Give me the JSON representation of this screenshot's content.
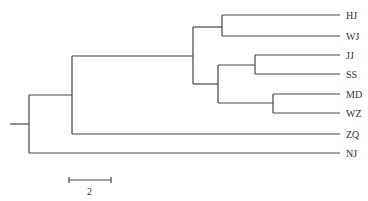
{
  "diagram": {
    "type": "phylogenetic-tree",
    "leaves": [
      "HJ",
      "WJ",
      "JJ",
      "SS",
      "MD",
      "WZ",
      "ZQ",
      "NJ"
    ],
    "newick": "(((((HJ,WJ),((JJ,SS),(MD,WZ))),ZQ),NJ));",
    "scale_bar": {
      "label": "2"
    },
    "line_color": "#444444"
  },
  "labels": {
    "hj": "HJ",
    "wj": "WJ",
    "jj": "JJ",
    "ss": "SS",
    "md": "MD",
    "wz": "WZ",
    "zq": "ZQ",
    "nj": "NJ",
    "scale": "2"
  }
}
